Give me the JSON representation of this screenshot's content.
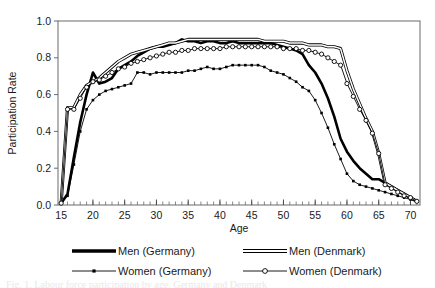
{
  "figure": {
    "caption_partial": "Fig. 1. Labour force participation by age, Germany and Denmark"
  },
  "chart_data": {
    "type": "line",
    "title": "",
    "xlabel": "Age",
    "ylabel": "Participation Rate",
    "xlim": [
      14.5,
      71.5
    ],
    "ylim": [
      0.0,
      1.0
    ],
    "grid": false,
    "legend_position": "below",
    "xticks": [
      15,
      20,
      25,
      30,
      35,
      40,
      45,
      50,
      55,
      60,
      65,
      70
    ],
    "xtick_labels": [
      "15",
      "20",
      "25",
      "30",
      "35",
      "40",
      "45",
      "50",
      "55",
      "60",
      "65",
      "70"
    ],
    "xminor_tick_step": 1,
    "yticks": [
      0.0,
      0.2,
      0.4,
      0.6,
      0.8,
      1.0
    ],
    "ytick_labels": [
      "0.0",
      "0.2",
      "0.4",
      "0.6",
      "0.8",
      "1.0"
    ],
    "x": [
      15,
      16,
      17,
      18,
      19,
      20,
      21,
      22,
      23,
      24,
      25,
      26,
      27,
      28,
      29,
      30,
      31,
      32,
      33,
      34,
      35,
      36,
      37,
      38,
      39,
      40,
      41,
      42,
      43,
      44,
      45,
      46,
      47,
      48,
      49,
      50,
      51,
      52,
      53,
      54,
      55,
      56,
      57,
      58,
      59,
      60,
      61,
      62,
      63,
      64,
      65,
      66,
      67,
      68,
      69,
      70,
      71
    ],
    "series": [
      {
        "name": "Men (Germany)",
        "style": "thick-solid",
        "color": "#000000",
        "marker": "none",
        "values": [
          0.01,
          0.06,
          0.26,
          0.45,
          0.6,
          0.72,
          0.66,
          0.67,
          0.69,
          0.74,
          0.76,
          0.78,
          0.81,
          0.83,
          0.85,
          0.86,
          0.86,
          0.87,
          0.88,
          0.9,
          0.89,
          0.89,
          0.88,
          0.89,
          0.89,
          0.88,
          0.88,
          0.89,
          0.88,
          0.88,
          0.88,
          0.88,
          0.88,
          0.88,
          0.87,
          0.86,
          0.85,
          0.84,
          0.82,
          0.76,
          0.72,
          0.66,
          0.58,
          0.48,
          0.36,
          0.29,
          0.24,
          0.2,
          0.17,
          0.14,
          0.14,
          0.12,
          0.1,
          0.08,
          0.06,
          0.04,
          0.02
        ]
      },
      {
        "name": "Men (Denmark)",
        "style": "double-line",
        "color": "#000000",
        "marker": "none",
        "values": [
          0.01,
          0.53,
          0.53,
          0.6,
          0.65,
          0.67,
          0.69,
          0.72,
          0.75,
          0.78,
          0.8,
          0.82,
          0.83,
          0.84,
          0.85,
          0.86,
          0.87,
          0.88,
          0.88,
          0.89,
          0.9,
          0.9,
          0.9,
          0.9,
          0.9,
          0.9,
          0.9,
          0.9,
          0.9,
          0.9,
          0.9,
          0.9,
          0.89,
          0.89,
          0.89,
          0.89,
          0.88,
          0.88,
          0.88,
          0.87,
          0.87,
          0.87,
          0.86,
          0.86,
          0.85,
          0.73,
          0.63,
          0.55,
          0.47,
          0.4,
          0.28,
          0.12,
          0.1,
          0.08,
          0.06,
          0.04,
          0.02
        ]
      },
      {
        "name": "Women (Germany)",
        "style": "thin-marker",
        "color": "#000000",
        "marker": "small-filled-square",
        "values": [
          0.01,
          0.05,
          0.22,
          0.4,
          0.52,
          0.57,
          0.6,
          0.62,
          0.63,
          0.64,
          0.65,
          0.66,
          0.72,
          0.72,
          0.71,
          0.72,
          0.72,
          0.72,
          0.72,
          0.72,
          0.73,
          0.73,
          0.74,
          0.75,
          0.74,
          0.74,
          0.75,
          0.76,
          0.76,
          0.76,
          0.76,
          0.76,
          0.75,
          0.73,
          0.72,
          0.71,
          0.69,
          0.67,
          0.64,
          0.62,
          0.57,
          0.5,
          0.42,
          0.33,
          0.25,
          0.17,
          0.13,
          0.11,
          0.1,
          0.09,
          0.08,
          0.07,
          0.06,
          0.05,
          0.04,
          0.03,
          0.02
        ]
      },
      {
        "name": "Women (Denmark)",
        "style": "thin-marker",
        "color": "#000000",
        "marker": "hollow-circle",
        "values": [
          0.01,
          0.52,
          0.52,
          0.58,
          0.64,
          0.67,
          0.68,
          0.7,
          0.72,
          0.74,
          0.75,
          0.77,
          0.78,
          0.79,
          0.8,
          0.81,
          0.82,
          0.83,
          0.83,
          0.84,
          0.84,
          0.85,
          0.85,
          0.85,
          0.85,
          0.85,
          0.86,
          0.86,
          0.86,
          0.86,
          0.86,
          0.86,
          0.86,
          0.86,
          0.86,
          0.85,
          0.85,
          0.85,
          0.84,
          0.84,
          0.83,
          0.82,
          0.8,
          0.78,
          0.76,
          0.66,
          0.59,
          0.52,
          0.46,
          0.39,
          0.28,
          0.11,
          0.09,
          0.07,
          0.05,
          0.04,
          0.02
        ]
      }
    ],
    "legend": [
      {
        "label": "Men (Germany)",
        "style": "thick-solid",
        "marker": "none"
      },
      {
        "label": "Men (Denmark)",
        "style": "double-line",
        "marker": "none"
      },
      {
        "label": "Women (Germany)",
        "style": "thin-marker",
        "marker": "small-filled-square"
      },
      {
        "label": "Women (Denmark)",
        "style": "thin-marker",
        "marker": "hollow-circle"
      }
    ]
  }
}
